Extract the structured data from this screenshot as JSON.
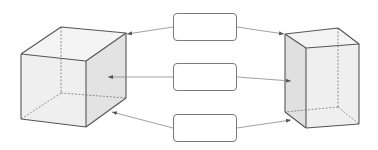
{
  "diagram": {
    "title": "",
    "left_shape": {
      "name": "cube",
      "label": ""
    },
    "right_shape": {
      "name": "rectangular-prism",
      "label": ""
    },
    "boxes": [
      {
        "label": ""
      },
      {
        "label": ""
      },
      {
        "label": ""
      }
    ],
    "colors": {
      "edge": "#555555",
      "hidden_edge": "#777777",
      "face_light": "#f1f1f1",
      "face_shade": "#e2e2e2",
      "arrow": "#8a8a8a",
      "box_border": "#7a7a7a"
    }
  }
}
